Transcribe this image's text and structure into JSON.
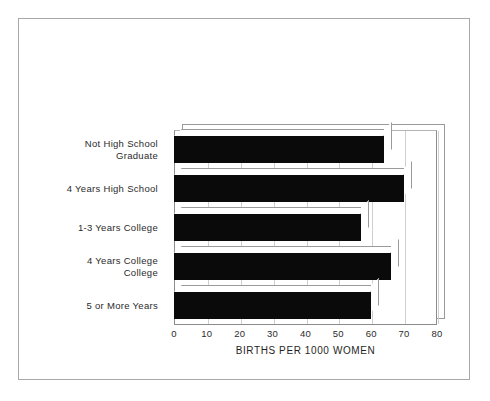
{
  "chart_data": {
    "type": "bar",
    "orientation": "horizontal",
    "title": "",
    "subtitle": "",
    "xlabel": "BIRTHS PER 1000 WOMEN",
    "ylabel": "",
    "categories": [
      "Not High School Graduate",
      "4 Years High School",
      "1-3 Years College",
      "4 Years College College",
      "5 or More Years"
    ],
    "category_lines": [
      [
        "Not High School",
        "Graduate"
      ],
      [
        "4 Years High School"
      ],
      [
        "1-3 Years College"
      ],
      [
        "4 Years College",
        "College"
      ],
      [
        "5 or More Years"
      ]
    ],
    "values": [
      64,
      70,
      57,
      66,
      60
    ],
    "xlim": [
      0,
      80
    ],
    "xticks": [
      0,
      10,
      20,
      30,
      40,
      50,
      60,
      70,
      80
    ],
    "xtick_labels": [
      "0",
      "10",
      "20",
      "30",
      "40",
      "50",
      "60",
      "70",
      "80"
    ],
    "grid": true,
    "grid_axis": "x",
    "legend": false,
    "legend_position": "none",
    "bar_color": "#0a0a0a",
    "grid_color": "#cfcfcf",
    "frame_color": "#8c8c8c",
    "style": "3d-extruded"
  },
  "figure": {
    "background_color": "#ffffff",
    "border_color": "#a8a8a8"
  }
}
